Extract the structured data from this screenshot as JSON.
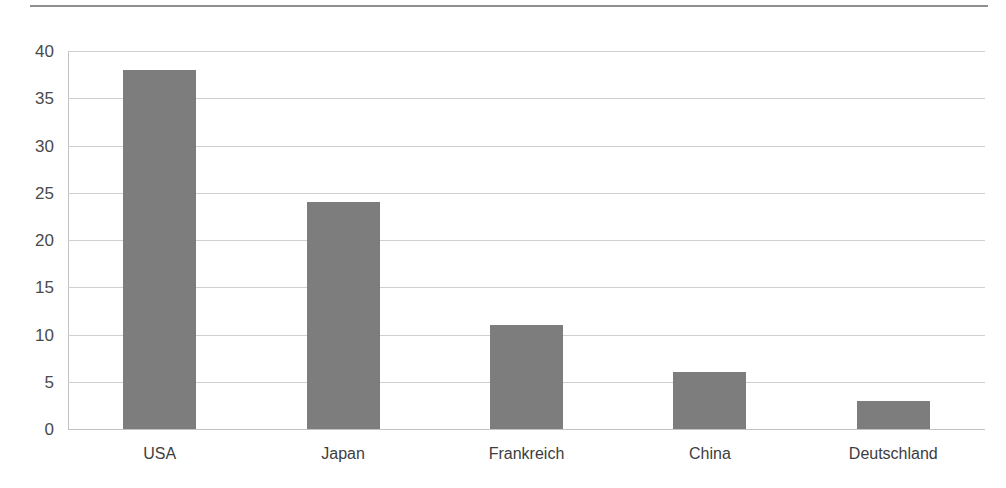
{
  "chart_data": {
    "type": "bar",
    "title": "",
    "subtitle": "",
    "xlabel": "",
    "ylabel": "",
    "categories": [
      "USA",
      "Japan",
      "Frankreich",
      "China",
      "Deutschland"
    ],
    "values": [
      38,
      24,
      11,
      6,
      3
    ],
    "ylim": [
      0,
      40
    ],
    "yticks": [
      0,
      5,
      10,
      15,
      20,
      25,
      30,
      35,
      40
    ],
    "ytick_labels": [
      "0",
      "5",
      "10",
      "15",
      "20",
      "25",
      "30",
      "35",
      "40"
    ],
    "grid": true,
    "grid_axis": "y",
    "legend": false,
    "legend_position": "none",
    "series": [
      {
        "name": "",
        "values": [
          38,
          24,
          11,
          6,
          3
        ]
      }
    ],
    "annotations": [],
    "colors": {
      "bar_fill": "#7d7d7d",
      "gridline": "#cfcfcf",
      "axis_line": "#c2c2c2",
      "tick_label": "#4a4a4a",
      "category_label": "#3d3d3d",
      "top_rule": "#8f8f8f",
      "background": "#ffffff"
    }
  }
}
